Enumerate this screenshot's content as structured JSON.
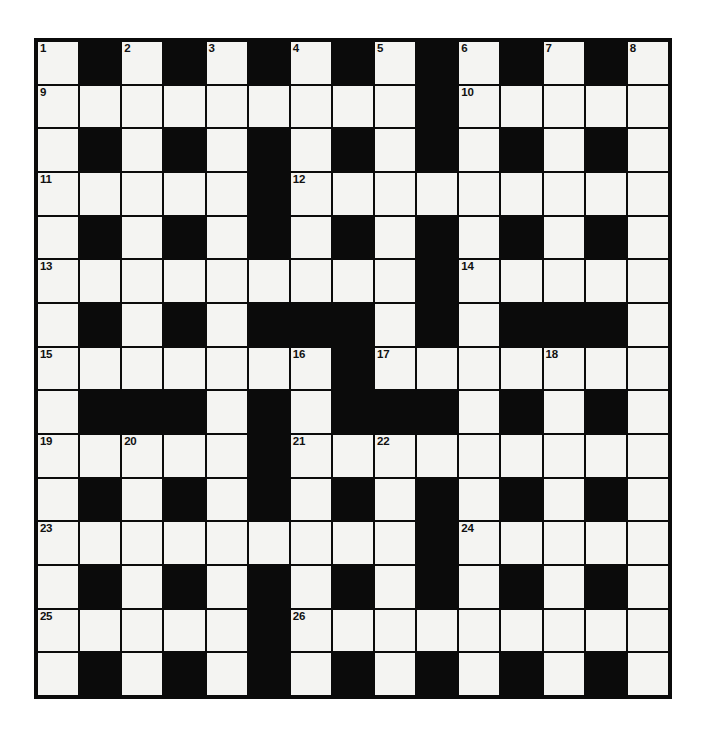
{
  "page": {
    "kind": "crossword-puzzle-grid",
    "background_color": "#ffffff"
  },
  "grid": {
    "rows": 15,
    "columns": 15,
    "white_cell_color": "#f4f4f2",
    "black_cell_color": "#0b0b0b",
    "border_color": "#0b0b0b",
    "numbered_clue_count": 26,
    "cells": [
      [
        "W",
        "B",
        "W",
        "B",
        "W",
        "B",
        "W",
        "B",
        "W",
        "B",
        "W",
        "B",
        "W",
        "B",
        "W"
      ],
      [
        "W",
        "W",
        "W",
        "W",
        "W",
        "W",
        "W",
        "W",
        "W",
        "B",
        "W",
        "W",
        "W",
        "W",
        "W"
      ],
      [
        "W",
        "B",
        "W",
        "B",
        "W",
        "B",
        "W",
        "B",
        "W",
        "B",
        "W",
        "B",
        "W",
        "B",
        "W"
      ],
      [
        "W",
        "W",
        "W",
        "W",
        "W",
        "B",
        "W",
        "W",
        "W",
        "W",
        "W",
        "W",
        "W",
        "W",
        "W"
      ],
      [
        "W",
        "B",
        "W",
        "B",
        "W",
        "B",
        "W",
        "B",
        "W",
        "B",
        "W",
        "B",
        "W",
        "B",
        "W"
      ],
      [
        "W",
        "W",
        "W",
        "W",
        "W",
        "W",
        "W",
        "W",
        "W",
        "B",
        "W",
        "W",
        "W",
        "W",
        "W"
      ],
      [
        "W",
        "B",
        "W",
        "B",
        "W",
        "B",
        "B",
        "B",
        "W",
        "B",
        "W",
        "B",
        "B",
        "B",
        "W"
      ],
      [
        "W",
        "W",
        "W",
        "W",
        "W",
        "W",
        "W",
        "B",
        "W",
        "W",
        "W",
        "W",
        "W",
        "W",
        "W"
      ],
      [
        "W",
        "B",
        "B",
        "B",
        "W",
        "B",
        "W",
        "B",
        "B",
        "B",
        "W",
        "B",
        "W",
        "B",
        "W"
      ],
      [
        "W",
        "W",
        "W",
        "W",
        "W",
        "B",
        "W",
        "W",
        "W",
        "W",
        "W",
        "W",
        "W",
        "W",
        "W"
      ],
      [
        "W",
        "B",
        "W",
        "B",
        "W",
        "B",
        "W",
        "B",
        "W",
        "B",
        "W",
        "B",
        "W",
        "B",
        "W"
      ],
      [
        "W",
        "W",
        "W",
        "W",
        "W",
        "W",
        "W",
        "W",
        "W",
        "B",
        "W",
        "W",
        "W",
        "W",
        "W"
      ],
      [
        "W",
        "B",
        "W",
        "B",
        "W",
        "B",
        "W",
        "B",
        "W",
        "B",
        "W",
        "B",
        "W",
        "B",
        "W"
      ],
      [
        "W",
        "W",
        "W",
        "W",
        "W",
        "B",
        "W",
        "W",
        "W",
        "W",
        "W",
        "W",
        "W",
        "W",
        "W"
      ],
      [
        "W",
        "B",
        "W",
        "B",
        "W",
        "B",
        "W",
        "B",
        "W",
        "B",
        "W",
        "B",
        "W",
        "B",
        "W"
      ]
    ],
    "numbers": [
      {
        "row": 1,
        "col": 1,
        "label": "1"
      },
      {
        "row": 1,
        "col": 3,
        "label": "2"
      },
      {
        "row": 1,
        "col": 5,
        "label": "3"
      },
      {
        "row": 1,
        "col": 7,
        "label": "4"
      },
      {
        "row": 1,
        "col": 9,
        "label": "5"
      },
      {
        "row": 1,
        "col": 11,
        "label": "6"
      },
      {
        "row": 1,
        "col": 13,
        "label": "7"
      },
      {
        "row": 1,
        "col": 15,
        "label": "8"
      },
      {
        "row": 2,
        "col": 1,
        "label": "9"
      },
      {
        "row": 2,
        "col": 11,
        "label": "10"
      },
      {
        "row": 4,
        "col": 1,
        "label": "11"
      },
      {
        "row": 4,
        "col": 7,
        "label": "12"
      },
      {
        "row": 6,
        "col": 1,
        "label": "13"
      },
      {
        "row": 6,
        "col": 11,
        "label": "14"
      },
      {
        "row": 8,
        "col": 1,
        "label": "15"
      },
      {
        "row": 8,
        "col": 7,
        "label": "16"
      },
      {
        "row": 8,
        "col": 9,
        "label": "17"
      },
      {
        "row": 8,
        "col": 13,
        "label": "18"
      },
      {
        "row": 10,
        "col": 1,
        "label": "19"
      },
      {
        "row": 10,
        "col": 3,
        "label": "20"
      },
      {
        "row": 10,
        "col": 7,
        "label": "21"
      },
      {
        "row": 10,
        "col": 9,
        "label": "22"
      },
      {
        "row": 12,
        "col": 1,
        "label": "23"
      },
      {
        "row": 12,
        "col": 11,
        "label": "24"
      },
      {
        "row": 14,
        "col": 1,
        "label": "25"
      },
      {
        "row": 14,
        "col": 7,
        "label": "26"
      }
    ],
    "letters": []
  }
}
